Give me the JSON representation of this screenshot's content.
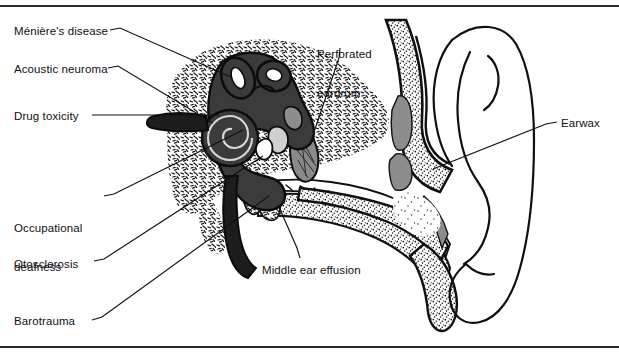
{
  "figure": {
    "type": "medical-anatomical-diagram",
    "background_color": "#ffffff",
    "ink_color": "#101010",
    "bone_fill": "#ffffff",
    "cartilage_gray": "#8c8c8c",
    "inner_ear_dark": "#3a3a3a",
    "rule_color": "#2b2b2b"
  },
  "rules": {
    "top_label": "top-border-rule",
    "bottom_label": "bottom-border-rule"
  },
  "labels": [
    {
      "id": "menieres-disease",
      "text": "Ménière's disease",
      "x": 14,
      "y": 25,
      "lines": [
        "Ménière's disease"
      ]
    },
    {
      "id": "acoustic-neuroma",
      "text": "Acoustic neuroma",
      "x": 14,
      "y": 63,
      "lines": [
        "Acoustic neuroma"
      ]
    },
    {
      "id": "drug-toxicity",
      "text": "Drug toxicity",
      "x": 14,
      "y": 110,
      "lines": [
        "Drug toxicity"
      ]
    },
    {
      "id": "occupational-deafness",
      "text": "Occupational deafness",
      "x": 14,
      "y": 196,
      "lines": [
        "Occupational",
        "deafness"
      ]
    },
    {
      "id": "otosclerosis",
      "text": "Otosclerosis",
      "x": 14,
      "y": 258,
      "lines": [
        "Otosclerosis"
      ]
    },
    {
      "id": "barotrauma",
      "text": "Barotrauma",
      "x": 14,
      "y": 315,
      "lines": [
        "Barotrauma"
      ]
    },
    {
      "id": "perforated-eardrum",
      "text": "Perforated eardrum",
      "x": 317,
      "y": 22,
      "lines": [
        "Perforated",
        "eardrum"
      ]
    },
    {
      "id": "middle-ear-effusion",
      "text": "Middle ear effusion",
      "x": 262,
      "y": 264,
      "lines": [
        "Middle ear effusion"
      ]
    },
    {
      "id": "earwax",
      "text": "Earwax",
      "x": 561,
      "y": 117,
      "lines": [
        "Earwax"
      ]
    }
  ],
  "leader_lines": [
    {
      "id": "leader-menieres-disease",
      "from": [
        110,
        30
      ],
      "to": [
        230,
        77
      ]
    },
    {
      "id": "leader-acoustic-neuroma",
      "from": [
        108,
        68
      ],
      "to": [
        212,
        122
      ]
    },
    {
      "id": "leader-drug-toxicity",
      "from": [
        92,
        115
      ],
      "to": [
        218,
        115
      ]
    },
    {
      "id": "leader-occupational-deafness",
      "from": [
        104,
        196
      ],
      "to": [
        242,
        130
      ]
    },
    {
      "id": "leader-otosclerosis",
      "from": [
        94,
        261
      ],
      "to": [
        262,
        156
      ]
    },
    {
      "id": "leader-barotrauma",
      "from": [
        92,
        320
      ],
      "to": [
        268,
        196
      ]
    },
    {
      "id": "leader-perforated-eardrum",
      "from": [
        340,
        48
      ],
      "to": [
        311,
        140
      ]
    },
    {
      "id": "leader-middle-ear-effusion",
      "from": [
        300,
        258
      ],
      "to": [
        278,
        206
      ]
    },
    {
      "id": "leader-earwax",
      "from": [
        556,
        122
      ],
      "to": [
        434,
        168
      ]
    }
  ],
  "anatomy_parts": [
    {
      "id": "pinna-outer-ear",
      "name": "pinna"
    },
    {
      "id": "ear-canal",
      "name": "external auditory canal"
    },
    {
      "id": "eardrum",
      "name": "tympanic membrane"
    },
    {
      "id": "ossicles",
      "name": "middle ear ossicles"
    },
    {
      "id": "cochlea",
      "name": "cochlea"
    },
    {
      "id": "semicircular-canals",
      "name": "semicircular canals"
    },
    {
      "id": "vestibulocochlear-nerve",
      "name": "auditory nerve"
    },
    {
      "id": "eustachian-tube",
      "name": "eustachian tube"
    },
    {
      "id": "temporal-bone",
      "name": "temporal bone (stippled)"
    },
    {
      "id": "earwax-deposit",
      "name": "cerumen in canal"
    }
  ]
}
